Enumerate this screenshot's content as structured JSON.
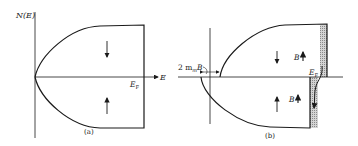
{
  "figure": {
    "panel_a": {
      "y_axis_label": "N(E)",
      "x_axis_label": "E",
      "fermi_label": "E",
      "fermi_subscript": "F",
      "caption": "(a)",
      "upper_arrow": "spin-down",
      "lower_arrow": "spin-up"
    },
    "panel_b": {
      "splitting_label_prefix": "2 m",
      "splitting_label_subscript": "m",
      "splitting_label_suffix": "B",
      "field_label_upper": "B",
      "field_label_lower": "B",
      "fermi_label": "E",
      "fermi_subscript": "F",
      "caption": "(b)",
      "upper_arrow": "spin-down",
      "lower_arrow": "spin-up"
    },
    "colors": {
      "line": "#1a1a1a",
      "shading": "#b8b8b8"
    }
  }
}
